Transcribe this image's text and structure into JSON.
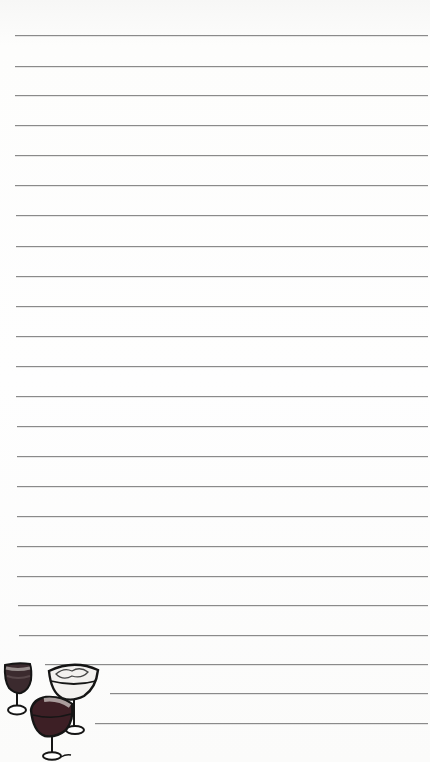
{
  "page": {
    "type": "lined notepad paper",
    "background_color": "#fbfbfa",
    "line_color": "#8a8a8a",
    "line_spacing_px": 30
  },
  "lines": [
    {
      "y": 35,
      "x1": 15,
      "x2": 428
    },
    {
      "y": 66,
      "x1": 15,
      "x2": 428
    },
    {
      "y": 95,
      "x1": 15,
      "x2": 428
    },
    {
      "y": 125,
      "x1": 15,
      "x2": 428
    },
    {
      "y": 155,
      "x1": 15,
      "x2": 428
    },
    {
      "y": 185,
      "x1": 15,
      "x2": 428
    },
    {
      "y": 215,
      "x1": 16,
      "x2": 428
    },
    {
      "y": 246,
      "x1": 16,
      "x2": 428
    },
    {
      "y": 276,
      "x1": 16,
      "x2": 428
    },
    {
      "y": 306,
      "x1": 16,
      "x2": 428
    },
    {
      "y": 336,
      "x1": 16,
      "x2": 428
    },
    {
      "y": 366,
      "x1": 16,
      "x2": 428
    },
    {
      "y": 396,
      "x1": 16,
      "x2": 428
    },
    {
      "y": 426,
      "x1": 17,
      "x2": 428
    },
    {
      "y": 456,
      "x1": 17,
      "x2": 428
    },
    {
      "y": 486,
      "x1": 17,
      "x2": 428
    },
    {
      "y": 516,
      "x1": 17,
      "x2": 428
    },
    {
      "y": 546,
      "x1": 17,
      "x2": 428
    },
    {
      "y": 576,
      "x1": 17,
      "x2": 428
    },
    {
      "y": 605,
      "x1": 18,
      "x2": 428
    },
    {
      "y": 635,
      "x1": 19,
      "x2": 428
    },
    {
      "y": 664,
      "x1": 45,
      "x2": 428
    },
    {
      "y": 693,
      "x1": 110,
      "x2": 428
    },
    {
      "y": 723,
      "x1": 95,
      "x2": 428
    }
  ],
  "illustration": {
    "name": "sketched wine glasses",
    "items": [
      "small red wine glass",
      "wide coupe glass",
      "round red wine glass"
    ],
    "ink_color": "#1a1a1a",
    "wine_color": "#3a1c22"
  }
}
